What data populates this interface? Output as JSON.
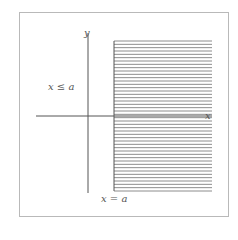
{
  "diagram": {
    "title": "",
    "labels": {
      "y_axis": "y",
      "x_axis": "x",
      "region": "x ≤ a",
      "boundary": "x = a"
    },
    "colors": {
      "frame_border": "#b9b9b9",
      "axis": "#555555",
      "hatch": "#6f6f6f",
      "text": "#555555",
      "background": "#ffffff"
    },
    "geometry": {
      "frame": {
        "x": 19,
        "y": 12,
        "w": 210,
        "h": 205
      },
      "y_axis_x": 88,
      "y_axis_range": [
        33,
        193
      ],
      "x_axis_y": 116,
      "x_axis_range": [
        36,
        212
      ],
      "boundary_x": 114,
      "hatch_region": {
        "x1": 114,
        "x2": 212,
        "y1": 41,
        "y2": 191
      },
      "hatch_line_count": 46
    }
  }
}
